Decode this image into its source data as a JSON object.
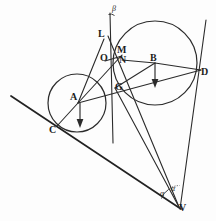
{
  "figure": {
    "background_color": "#fdfdfd",
    "ink_color": "#2b2b2b",
    "width": 216,
    "height": 221
  },
  "points": [
    {
      "id": "beta_mark",
      "label": "β",
      "x": 113,
      "y": 9,
      "kind": "angle"
    },
    {
      "id": "L",
      "label": "L",
      "x": 101,
      "y": 34,
      "kind": "vertex"
    },
    {
      "id": "M",
      "label": "M",
      "x": 119,
      "y": 50,
      "kind": "vertex"
    },
    {
      "id": "O",
      "label": "O",
      "x": 103,
      "y": 57,
      "kind": "vertex"
    },
    {
      "id": "N",
      "label": "N",
      "x": 120,
      "y": 59,
      "kind": "vertex"
    },
    {
      "id": "B",
      "label": "B",
      "x": 152,
      "y": 58,
      "kind": "center"
    },
    {
      "id": "D",
      "label": "D",
      "x": 200,
      "y": 72,
      "kind": "vertex"
    },
    {
      "id": "G",
      "label": "G",
      "x": 117,
      "y": 86,
      "kind": "vertex"
    },
    {
      "id": "A",
      "label": "A",
      "x": 73,
      "y": 96,
      "kind": "center"
    },
    {
      "id": "C",
      "label": "C",
      "x": 52,
      "y": 129,
      "kind": "vertex"
    },
    {
      "id": "alpha_left",
      "label": "α",
      "x": 161,
      "y": 193,
      "kind": "angle"
    },
    {
      "id": "alpha_right",
      "label": "α",
      "x": 172,
      "y": 188,
      "kind": "angle"
    },
    {
      "id": "V",
      "label": "V",
      "x": 180,
      "y": 207,
      "kind": "vertex"
    }
  ],
  "circles": [
    {
      "id": "circle-A",
      "center_label": "A",
      "cx": 77,
      "cy": 103,
      "r": 29
    },
    {
      "id": "circle-B",
      "center_label": "B",
      "cx": 155,
      "cy": 63,
      "r": 42
    }
  ],
  "segments": [
    {
      "id": "tangent-line-CV",
      "from": "left-edge",
      "to": "V",
      "x1": 11,
      "y1": 96,
      "x2": 181,
      "y2": 209
    },
    {
      "id": "line-LV",
      "from": "L",
      "to": "V",
      "x1": 108,
      "y1": 36,
      "x2": 179,
      "y2": 207
    },
    {
      "id": "line-DV",
      "from": "D-upper",
      "to": "V",
      "x1": 206,
      "y1": 20,
      "x2": 180,
      "y2": 209
    },
    {
      "id": "line-vertical-beta",
      "from": "beta",
      "to": "below-G",
      "x1": 110,
      "y1": 13,
      "x2": 113,
      "y2": 143
    },
    {
      "id": "line-AD",
      "from": "A",
      "to": "D",
      "x1": 78,
      "y1": 103,
      "x2": 201,
      "y2": 70
    },
    {
      "id": "line-AL",
      "from": "A",
      "to": "L",
      "x1": 78,
      "y1": 103,
      "x2": 104,
      "y2": 39
    },
    {
      "id": "line-AC",
      "from": "A",
      "to": "C",
      "x1": 78,
      "y1": 103,
      "x2": 57,
      "y2": 126
    },
    {
      "id": "line-AM",
      "from": "A",
      "to": "M",
      "x1": 78,
      "y1": 103,
      "x2": 122,
      "y2": 55
    },
    {
      "id": "line-ON",
      "from": "O",
      "to": "N",
      "x1": 105,
      "y1": 61,
      "x2": 122,
      "y2": 57
    },
    {
      "id": "line-NB",
      "from": "N",
      "to": "B",
      "x1": 122,
      "y1": 60,
      "x2": 155,
      "y2": 63
    },
    {
      "id": "line-GB",
      "from": "G",
      "to": "B",
      "x1": 115,
      "y1": 88,
      "x2": 155,
      "y2": 63
    },
    {
      "id": "line-GV",
      "from": "G",
      "to": "V",
      "x1": 115,
      "y1": 88,
      "x2": 179,
      "y2": 207
    },
    {
      "id": "line-BD",
      "from": "B",
      "to": "D",
      "x1": 155,
      "y1": 63,
      "x2": 201,
      "y2": 70
    }
  ],
  "arrows": [
    {
      "id": "arrow-A-down",
      "anchor": "A",
      "x": 80,
      "y1": 103,
      "y2": 126,
      "direction": "down"
    },
    {
      "id": "arrow-B-down",
      "anchor": "B",
      "x": 155,
      "y1": 63,
      "y2": 87,
      "direction": "down"
    }
  ],
  "angles": [
    {
      "id": "angle-beta",
      "label": "β",
      "at": "top vertical line"
    },
    {
      "id": "angle-alpha-left",
      "label": "α",
      "at": "V between tangent and GV"
    },
    {
      "id": "angle-alpha-right",
      "label": "α",
      "at": "V between GV and DV"
    }
  ]
}
